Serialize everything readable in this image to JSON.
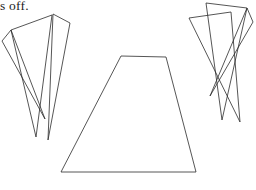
{
  "page": {
    "width": 256,
    "height": 190,
    "background_color": "#ffffff",
    "ink_color": "#2b2b2b"
  },
  "caption": {
    "text_fragment": "s off."
  },
  "figure": {
    "name": "line-art-geometric-figure",
    "stroke_color": "#2b2b2b",
    "stroke_width": 0.8,
    "fill": "none",
    "shapes": [
      {
        "id": "left-triangle-a",
        "label": "left thin triangle A",
        "points": "11,30 52,15 36,137"
      },
      {
        "id": "left-triangle-b",
        "label": "left thin triangle B",
        "points": "53,14 70,23 48,140"
      },
      {
        "id": "left-triangle-c",
        "label": "left sliver triangle C",
        "points": "11,30 2,41 45,119"
      },
      {
        "id": "center-trapezoid",
        "label": "central trapezoid",
        "points": "121,56 166,57 196,172 61,172"
      },
      {
        "id": "right-triangle-a",
        "label": "right thin triangle A",
        "points": "206,3 247,8 222,120"
      },
      {
        "id": "right-triangle-b",
        "label": "right thin triangle B",
        "points": "189,18 231,12 240,122"
      },
      {
        "id": "right-triangle-c",
        "label": "right sliver triangle C",
        "points": "247,8 253,22 210,96"
      }
    ]
  }
}
